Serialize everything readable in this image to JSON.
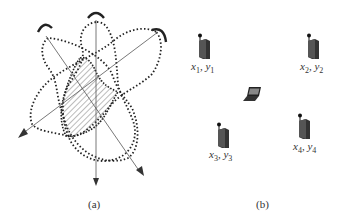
{
  "figure": {
    "panel_a": {
      "caption": "(a)",
      "description": "Three overlapping dotted directional antenna beam patterns with hatched intersection region",
      "antennas": 3
    },
    "panel_b": {
      "caption": "(b)",
      "access_points": [
        {
          "x_label": "x",
          "x_sub": "1",
          "y_label": "y",
          "y_sub": "1"
        },
        {
          "x_label": "x",
          "x_sub": "2",
          "y_label": "y",
          "y_sub": "2"
        },
        {
          "x_label": "x",
          "x_sub": "3",
          "y_label": "y",
          "y_sub": "3"
        },
        {
          "x_label": "x",
          "x_sub": "4",
          "y_label": "y",
          "y_sub": "4"
        }
      ],
      "device": "laptop-icon"
    },
    "colors": {
      "stroke": "#222222",
      "line": "#555555",
      "background": "#ffffff"
    }
  }
}
